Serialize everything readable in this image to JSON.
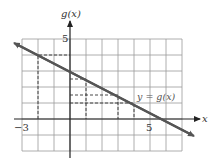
{
  "chart_data": {
    "type": "line",
    "title": "",
    "xlabel": "x",
    "ylabel": "g(x)",
    "x_tick_labels": [
      "-3",
      "5"
    ],
    "y_tick_labels": [
      "5"
    ],
    "xlim": [
      -3,
      7
    ],
    "ylim": [
      -2,
      5
    ],
    "grid": true,
    "series": [
      {
        "name": "y = g(x)",
        "equation": "g(x) = 3 - x/2",
        "x": [
          -3.5,
          -2,
          0,
          1,
          3,
          4,
          6,
          7.5
        ],
        "values": [
          4.75,
          4,
          3,
          2.5,
          1.5,
          1,
          0,
          -0.75
        ]
      }
    ],
    "dashed_guides": [
      {
        "x": -2,
        "y": 4
      },
      {
        "x": 1,
        "y": 2.5
      },
      {
        "x": 3,
        "y": 1.5
      },
      {
        "x": 4,
        "y": 1
      }
    ],
    "annotations": [
      "y = g(x)"
    ]
  },
  "labels": {
    "y_axis": "g(x)",
    "x_axis": "x",
    "tick_neg3": "−3",
    "tick_5x": "5",
    "tick_5y": "5",
    "curve": "y = g(x)"
  }
}
